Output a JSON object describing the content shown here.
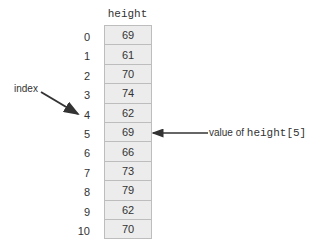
{
  "diagram": {
    "array_name": "height",
    "indices": [
      "0",
      "1",
      "2",
      "3",
      "4",
      "5",
      "6",
      "7",
      "8",
      "9",
      "10"
    ],
    "values": [
      "69",
      "61",
      "70",
      "74",
      "62",
      "69",
      "66",
      "73",
      "79",
      "62",
      "70"
    ],
    "annotations": {
      "index_label": "index",
      "index_points_to": "4",
      "value_label_prefix": "value of ",
      "value_label_code": "height[5]",
      "value_points_to": "5"
    },
    "colors": {
      "cell_fill": "#ececec",
      "cell_border": "#bdbdbd",
      "arrow": "#333333"
    }
  }
}
